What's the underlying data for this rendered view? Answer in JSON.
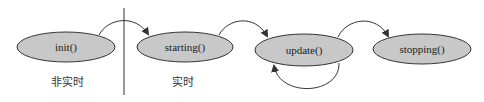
{
  "diagram": {
    "type": "state-lifecycle",
    "colors": {
      "node_fill": "#c8c8c8",
      "node_stroke": "#333333",
      "edge": "#333333",
      "divider": "#333333"
    },
    "nodes": [
      {
        "id": "init",
        "label": "init()"
      },
      {
        "id": "starting",
        "label": "starting()"
      },
      {
        "id": "update",
        "label": "update()"
      },
      {
        "id": "stopping",
        "label": "stopping()"
      }
    ],
    "edges": [
      {
        "from": "init",
        "to": "starting"
      },
      {
        "from": "starting",
        "to": "update"
      },
      {
        "from": "update",
        "to": "update",
        "kind": "self-loop"
      },
      {
        "from": "update",
        "to": "stopping"
      }
    ],
    "zones": [
      {
        "id": "non-realtime",
        "label": "非实时"
      },
      {
        "id": "realtime",
        "label": "实时"
      }
    ]
  }
}
